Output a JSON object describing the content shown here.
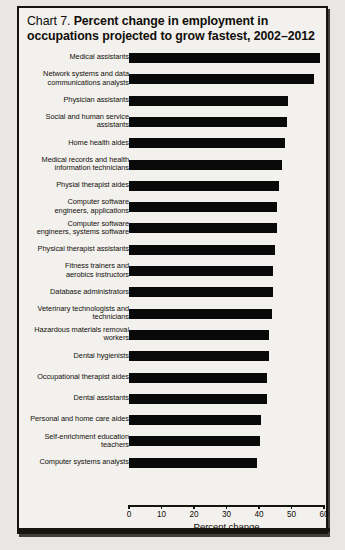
{
  "title": {
    "prefix": "Chart 7.",
    "line1": "Percent change in employment in",
    "line2": "occupations projected to grow fastest, 2002–2012"
  },
  "axis": {
    "label": "Percent change",
    "ticks": [
      "0",
      "10",
      "20",
      "30",
      "40",
      "50",
      "60"
    ],
    "min": 0,
    "max": 60
  },
  "colors": {
    "bar": "#09090a",
    "frame": "#16140f",
    "paper": "#f3f1ed",
    "text": "#100e0a"
  },
  "chart_data": {
    "type": "bar",
    "orientation": "horizontal",
    "title": "Chart 7. Percent change in employment in occupations projected to grow fastest, 2002–2012",
    "xlabel": "Percent change",
    "ylabel": "",
    "xlim": [
      0,
      60
    ],
    "xticks": [
      0,
      10,
      20,
      30,
      40,
      50,
      60
    ],
    "grid": false,
    "legend": null,
    "categories": [
      "Medical assistants",
      "Network systems and data communications analysts",
      "Physician assistants",
      "Social and human service assistants",
      "Home health aides",
      "Medical records and health information technicians",
      "Physial therapist aides",
      "Computer software engineers, applications",
      "Computer software engineers, systems software",
      "Physical therapist assistants",
      "Fitness trainers and aerobics instructors",
      "Database administrators",
      "Veterinary technologists and technicians",
      "Hazardous materials removal workers",
      "Dental hygienists",
      "Occupational therapist aides",
      "Dental assistants",
      "Personal and home care aides",
      "Self-enrichment education teachers",
      "Computer systems analysts"
    ],
    "values": [
      58.9,
      57.0,
      48.8,
      48.7,
      48.1,
      47.1,
      46.3,
      45.5,
      45.5,
      44.8,
      44.2,
      44.2,
      44.1,
      43.1,
      43.1,
      42.6,
      42.5,
      40.5,
      40.3,
      39.4
    ]
  },
  "labels": [
    {
      "lines": [
        "Medical assistants"
      ]
    },
    {
      "lines": [
        "Network systems and data",
        "communications analysts"
      ]
    },
    {
      "lines": [
        "Physician assistants"
      ]
    },
    {
      "lines": [
        "Social and human service",
        "assistants"
      ]
    },
    {
      "lines": [
        "Home health aides"
      ]
    },
    {
      "lines": [
        "Medical records and health",
        "information technicians"
      ]
    },
    {
      "lines": [
        "Physial therapist aides"
      ]
    },
    {
      "lines": [
        "Computer software",
        "engineers, applications"
      ]
    },
    {
      "lines": [
        "Computer software",
        "engineers, systems software"
      ]
    },
    {
      "lines": [
        "Physical therapist assistants"
      ]
    },
    {
      "lines": [
        "Fitness trainers and",
        "aerobics instructors"
      ]
    },
    {
      "lines": [
        "Database administrators"
      ]
    },
    {
      "lines": [
        "Veterinary technologists and",
        "technicians"
      ]
    },
    {
      "lines": [
        "Hazardous materials removal",
        "workers"
      ]
    },
    {
      "lines": [
        "Dental hygienists"
      ]
    },
    {
      "lines": [
        "Occupational therapist aides"
      ]
    },
    {
      "lines": [
        "Dental assistants"
      ]
    },
    {
      "lines": [
        "Personal and home care aides"
      ]
    },
    {
      "lines": [
        "Self-enrichment education",
        "teachers"
      ]
    },
    {
      "lines": [
        "Computer systems analysts"
      ]
    }
  ]
}
